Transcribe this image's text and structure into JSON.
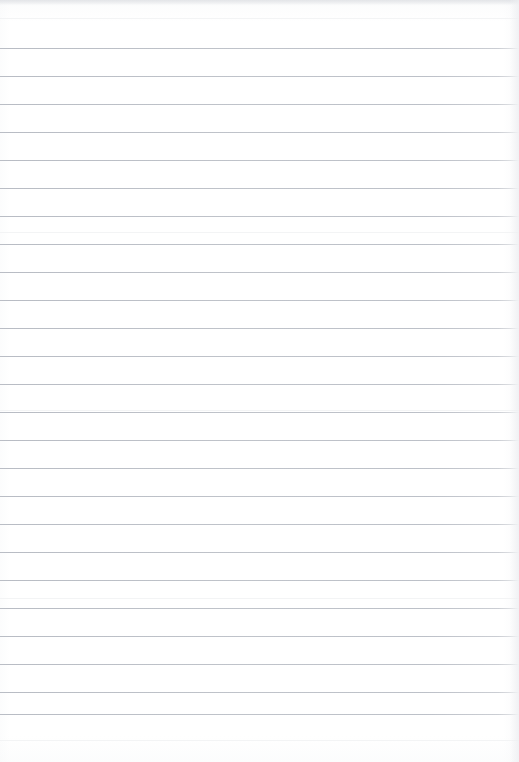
{
  "document": {
    "kind": "lined-notebook-paper",
    "page_width": 519,
    "page_height": 762,
    "background_color": "#ffffff",
    "content_text": "",
    "top_margin_px": 48,
    "bottom_margin_px": 47
  },
  "ruling": {
    "line_color": "#b9bdc5",
    "line_thickness_px": 1,
    "line_spacing_px": 28,
    "first_line_y": 48,
    "last_line_y": 714,
    "line_count": 25,
    "line_start_x": 0,
    "line_end_x": 519,
    "line_y_positions": [
      48,
      76,
      104,
      132,
      160,
      188,
      216,
      244,
      272,
      300,
      328,
      356,
      384,
      412,
      440,
      468,
      496,
      524,
      552,
      580,
      608,
      636,
      664,
      692,
      714
    ]
  },
  "scan_artifacts": {
    "top_edge_shadow_color": "#dee0e4",
    "right_edge_shadow_color": "#eeeff2",
    "band_y_positions": [
      18,
      232,
      410,
      598,
      740
    ]
  }
}
